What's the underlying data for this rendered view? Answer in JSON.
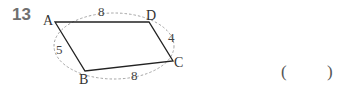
{
  "problem": {
    "number": "13",
    "answer_open": "(",
    "answer_close": ")"
  },
  "figure": {
    "vertices": {
      "A": "A",
      "B": "B",
      "C": "C",
      "D": "D"
    },
    "sides": {
      "AD": "8",
      "DC": "4",
      "AB": "5",
      "BC": "8"
    }
  }
}
